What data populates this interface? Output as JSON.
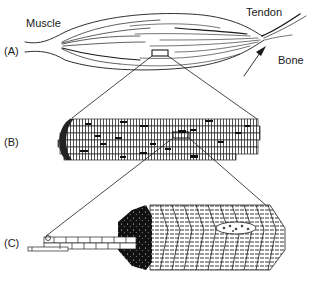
{
  "diagram": {
    "labels": {
      "muscle": "Muscle",
      "tendon": "Tendon",
      "bone": "Bone"
    },
    "panels": [
      {
        "id": "A",
        "label": "(A)",
        "depicts": "whole muscle attached by tendon to bone"
      },
      {
        "id": "B",
        "label": "(B)",
        "depicts": "muscle fiber bundle (enlarged from A)"
      },
      {
        "id": "C",
        "label": "(C)",
        "depicts": "myofibril cross-section with striations (enlarged from B)"
      }
    ],
    "colors": {
      "ink": "#1a1a1a",
      "background": "#ffffff"
    }
  }
}
